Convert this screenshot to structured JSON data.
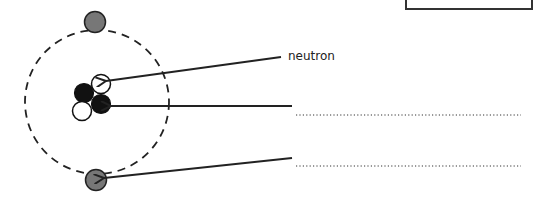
{
  "diagram": {
    "type": "atom-structure",
    "labels": {
      "neutron": "neutron",
      "answer_line_1": "",
      "answer_line_2": ""
    },
    "colors": {
      "electron": "#777777",
      "proton": "#111111",
      "neutron": "#ffffff",
      "stroke": "#222222"
    },
    "parts": [
      {
        "name": "neutron",
        "labelled": true
      },
      {
        "name": "proton",
        "labelled": false
      },
      {
        "name": "electron",
        "labelled": false
      }
    ],
    "answer_box": ""
  }
}
